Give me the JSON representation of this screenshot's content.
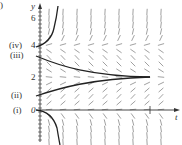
{
  "figure": {
    "axes": {
      "x_label": "t",
      "y_label": "y",
      "y_ticks": [
        {
          "value": 0,
          "label": "0"
        },
        {
          "value": 2,
          "label": "2"
        },
        {
          "value": 4,
          "label": "4"
        },
        {
          "value": 6,
          "label": "6"
        }
      ]
    },
    "curve_labels": {
      "i": "(i)",
      "ii": "(ii)",
      "iii": "(iii)",
      "iv": "(iv)"
    },
    "corner_mark": ")",
    "colors": {
      "curve": "#222222",
      "field": "#777777",
      "axis": "#333333"
    }
  },
  "chart_data": {
    "type": "line",
    "title": "",
    "xlabel": "t",
    "ylabel": "y",
    "ylim": [
      -2,
      7
    ],
    "equilibria": [
      0,
      2,
      4
    ],
    "series": [
      {
        "name": "(i)",
        "description": "starts at y=0 slightly, decreases to -infinity",
        "initial_y": 0
      },
      {
        "name": "(ii)",
        "description": "starts near y=1, increases toward y=2",
        "initial_y": 1
      },
      {
        "name": "(iii)",
        "description": "starts near y=3.5, decreases toward y=2",
        "initial_y": 3.5
      },
      {
        "name": "(iv)",
        "description": "starts at y=4, increases to +infinity",
        "initial_y": 4
      }
    ]
  }
}
